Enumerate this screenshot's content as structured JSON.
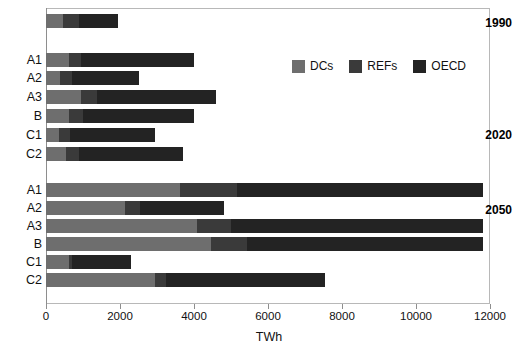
{
  "chart_data": {
    "type": "bar",
    "orientation": "horizontal",
    "stacked": true,
    "title": "",
    "xlabel": "TWh",
    "ylabel": "",
    "xlim": [
      0,
      12000
    ],
    "xticks": [
      0,
      2000,
      4000,
      6000,
      8000,
      10000,
      12000
    ],
    "xticklabels": [
      "0",
      "2000",
      "4000",
      "6000",
      "8000",
      "10000",
      "12000"
    ],
    "grid": false,
    "legend_position": "upper-right-inside",
    "series": [
      {
        "name": "DCs",
        "color": "#6e6e6e"
      },
      {
        "name": "REFs",
        "color": "#3a3a3a"
      },
      {
        "name": "OECD",
        "color": "#232323"
      }
    ],
    "groups": [
      {
        "period": "1990",
        "rows": [
          {
            "label": "",
            "DCs": 450,
            "REFs": 450,
            "OECD": 1050,
            "total": 1950
          }
        ]
      },
      {
        "period": "2020",
        "rows": [
          {
            "label": "A1",
            "DCs": 620,
            "REFs": 325,
            "OECD": 3055,
            "total": 4000
          },
          {
            "label": "A2",
            "DCs": 370,
            "REFs": 330,
            "OECD": 1820,
            "total": 2520
          },
          {
            "label": "A3",
            "DCs": 945,
            "REFs": 435,
            "OECD": 3215,
            "total": 4595
          },
          {
            "label": "B",
            "DCs": 620,
            "REFs": 380,
            "OECD": 2990,
            "total": 3990
          },
          {
            "label": "C1",
            "DCs": 350,
            "REFs": 300,
            "OECD": 2300,
            "total": 2950
          },
          {
            "label": "C2",
            "DCs": 540,
            "REFs": 360,
            "OECD": 2800,
            "total": 3700
          }
        ]
      },
      {
        "period": "2050",
        "rows": [
          {
            "label": "A1",
            "DCs": 3620,
            "REFs": 1540,
            "OECD": 6650,
            "total": 11810
          },
          {
            "label": "A2",
            "DCs": 2135,
            "REFs": 405,
            "OECD": 2270,
            "total": 4810
          },
          {
            "label": "A3",
            "DCs": 4080,
            "REFs": 920,
            "OECD": 6810,
            "total": 11810
          },
          {
            "label": "B",
            "DCs": 4460,
            "REFs": 970,
            "OECD": 6380,
            "total": 11810
          },
          {
            "label": "C1",
            "DCs": 620,
            "REFs": 80,
            "OECD": 1600,
            "total": 2300
          },
          {
            "label": "C2",
            "DCs": 2950,
            "REFs": 290,
            "OECD": 4300,
            "total": 7540
          }
        ]
      }
    ]
  },
  "legend": {
    "items": [
      {
        "label": "DCs",
        "key": "DCs"
      },
      {
        "label": "REFs",
        "key": "REFs"
      },
      {
        "label": "OECD",
        "key": "OECD"
      }
    ]
  },
  "axis": {
    "x_title": "TWh"
  },
  "periods": {
    "p1990": "1990",
    "p2020": "2020",
    "p2050": "2050"
  }
}
